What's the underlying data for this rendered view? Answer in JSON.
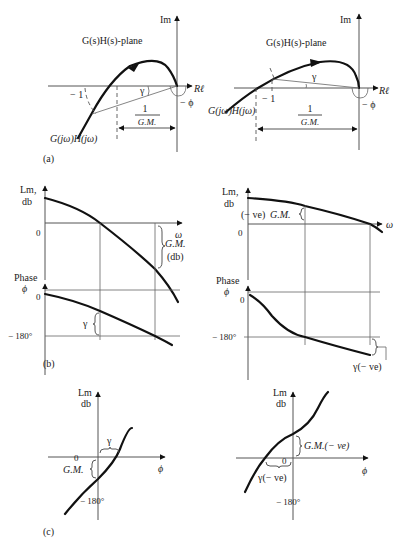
{
  "figure": {
    "panel_a": {
      "label": "(a)",
      "left": {
        "im_label": "Im",
        "re_label": "Rℓ",
        "plane_label": "G(s)H(s)-plane",
        "minus_one": "− 1",
        "gamma": "γ",
        "phi": "− ϕ",
        "gm_num": "1",
        "gm_den": "G.M.",
        "curve_label": "G(jω)H(jω)"
      },
      "right": {
        "im_label": "Im",
        "re_label": "Rℓ",
        "plane_label": "G(s)H(s)-plane",
        "minus_one": "− 1",
        "gamma": "γ",
        "phi": "− ϕ",
        "gm_num": "1",
        "gm_den": "G.M.",
        "curve_label": "G(jω)H(jω)"
      }
    },
    "panel_b": {
      "label": "(b)",
      "left": {
        "lm_label_1": "Lm,",
        "lm_label_2": "db",
        "zero_lm": "0",
        "omega": "ω",
        "gm_label": "G.M.",
        "gm_unit": "(db)",
        "phase_label_1": "Phase",
        "phase_label_2": "ϕ",
        "zero_phase": "0",
        "minus180": "− 180°",
        "gamma": "γ"
      },
      "right": {
        "lm_label_1": "Lm,",
        "lm_label_2": "db",
        "zero_lm": "0",
        "omega": "ω",
        "gm_label_prefix": "(− ve)",
        "gm_label": "G.M.",
        "phase_label_1": "Phase",
        "phase_label_2": "ϕ",
        "zero_phase": "0",
        "minus180": "− 180°",
        "gamma": "γ(− ve)"
      }
    },
    "panel_c": {
      "label": "(c)",
      "left": {
        "lm_label_1": "Lm",
        "lm_label_2": "db",
        "zero": "0",
        "phi": "ϕ",
        "gamma": "γ",
        "gm_label": "G.M.",
        "minus180": "− 180°"
      },
      "right": {
        "lm_label_1": "Lm",
        "lm_label_2": "db",
        "zero": "0",
        "phi": "ϕ",
        "gm_label": "G.M.(− ve)",
        "gamma": "γ(− ve)",
        "minus180": "− 180°"
      }
    }
  }
}
